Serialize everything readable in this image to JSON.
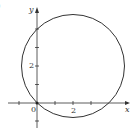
{
  "figure": {
    "part_label": ")",
    "axes": {
      "x_label": "x",
      "y_label": "y",
      "origin_label": "0",
      "x_tick_label": "2",
      "y_tick_label": "2"
    },
    "curve": {
      "type": "circle",
      "center": [
        2,
        2
      ],
      "radius": 2.83,
      "passes_through_origin": true
    },
    "colors": {
      "stroke": "#333333",
      "background": "#ffffff"
    }
  }
}
